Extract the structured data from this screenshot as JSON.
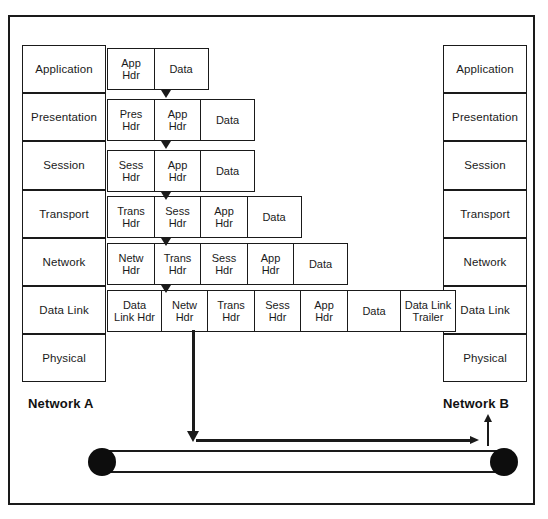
{
  "diagram": {
    "frame_color": "#1a1a1a",
    "background": "#ffffff"
  },
  "left_stack": {
    "name": "Network A protocol stack",
    "layers": [
      {
        "label": "Application"
      },
      {
        "label": "Presentation"
      },
      {
        "label": "Session"
      },
      {
        "label": "Transport"
      },
      {
        "label": "Network"
      },
      {
        "label": "Data Link"
      },
      {
        "label": "Physical"
      }
    ]
  },
  "right_stack": {
    "name": "Network B protocol stack",
    "layers": [
      {
        "label": "Application"
      },
      {
        "label": "Presentation"
      },
      {
        "label": "Session"
      },
      {
        "label": "Transport"
      },
      {
        "label": "Network"
      },
      {
        "label": "Data Link"
      },
      {
        "label": "Physical"
      }
    ]
  },
  "encapsulation_rows": [
    {
      "layer": "Application",
      "cells": [
        {
          "line1": "App",
          "line2": "Hdr"
        },
        {
          "line1": "Data",
          "line2": ""
        }
      ]
    },
    {
      "layer": "Presentation",
      "cells": [
        {
          "line1": "Pres",
          "line2": "Hdr"
        },
        {
          "line1": "App",
          "line2": "Hdr"
        },
        {
          "line1": "Data",
          "line2": ""
        }
      ]
    },
    {
      "layer": "Session",
      "cells": [
        {
          "line1": "Sess",
          "line2": "Hdr"
        },
        {
          "line1": "App",
          "line2": "Hdr"
        },
        {
          "line1": "Data",
          "line2": ""
        }
      ]
    },
    {
      "layer": "Transport",
      "cells": [
        {
          "line1": "Trans",
          "line2": "Hdr"
        },
        {
          "line1": "Sess",
          "line2": "Hdr"
        },
        {
          "line1": "App",
          "line2": "Hdr"
        },
        {
          "line1": "Data",
          "line2": ""
        }
      ]
    },
    {
      "layer": "Network",
      "cells": [
        {
          "line1": "Netw",
          "line2": "Hdr"
        },
        {
          "line1": "Trans",
          "line2": "Hdr"
        },
        {
          "line1": "Sess",
          "line2": "Hdr"
        },
        {
          "line1": "App",
          "line2": "Hdr"
        },
        {
          "line1": "Data",
          "line2": ""
        }
      ]
    },
    {
      "layer": "Data Link",
      "cells": [
        {
          "line1": "Data",
          "line2": "Link Hdr"
        },
        {
          "line1": "Netw",
          "line2": "Hdr"
        },
        {
          "line1": "Trans",
          "line2": "Hdr"
        },
        {
          "line1": "Sess",
          "line2": "Hdr"
        },
        {
          "line1": "App",
          "line2": "Hdr"
        },
        {
          "line1": "Data",
          "line2": ""
        },
        {
          "line1": "Data Link",
          "line2": "Trailer"
        }
      ]
    }
  ],
  "labels": {
    "network_a": "Network A",
    "network_b": "Network B"
  }
}
